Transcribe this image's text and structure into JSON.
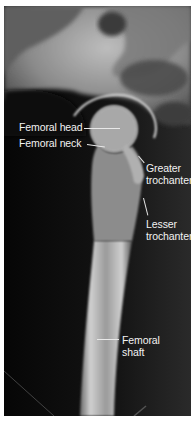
{
  "figure": {
    "labels": [
      {
        "id": "femoral-head",
        "lines": [
          "Femoral head"
        ]
      },
      {
        "id": "femoral-neck",
        "lines": [
          "Femoral neck"
        ]
      },
      {
        "id": "greater-trochanter",
        "lines": [
          "Greater",
          "trochanter"
        ]
      },
      {
        "id": "lesser-trochanter",
        "lines": [
          "Lesser",
          "trochanter"
        ]
      },
      {
        "id": "femoral-shaft",
        "lines": [
          "Femoral",
          "shaft"
        ]
      }
    ]
  }
}
